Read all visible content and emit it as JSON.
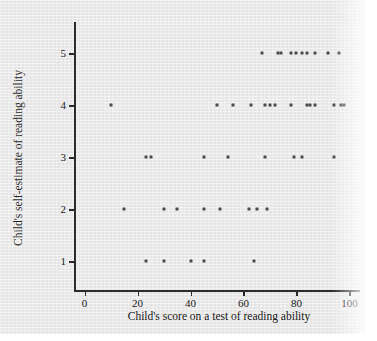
{
  "figure": {
    "background_color": "#e9e9e9",
    "axis_color": "#2b2b2b",
    "marker_color": "#4b4b4b"
  },
  "chart_data": {
    "type": "scatter",
    "title": "",
    "xlabel": "Child's score on a test of reading ability",
    "ylabel": "Child's self-estimate of reading ability",
    "xlim": [
      -4,
      104
    ],
    "ylim": [
      0.45,
      5.6
    ],
    "xticks": [
      0,
      20,
      40,
      60,
      80,
      100
    ],
    "xtick_labels": [
      "0",
      "20",
      "40",
      "60",
      "80",
      "100"
    ],
    "yticks": [
      1,
      2,
      3,
      4,
      5
    ],
    "ytick_labels": [
      "1",
      "2",
      "3",
      "4",
      "5"
    ],
    "grid": false,
    "legend": false,
    "marker": "square-dot",
    "points": [
      {
        "x": 23,
        "y": 1
      },
      {
        "x": 30,
        "y": 1
      },
      {
        "x": 40,
        "y": 1
      },
      {
        "x": 45,
        "y": 1
      },
      {
        "x": 64,
        "y": 1
      },
      {
        "x": 15,
        "y": 2
      },
      {
        "x": 30,
        "y": 2
      },
      {
        "x": 35,
        "y": 2
      },
      {
        "x": 45,
        "y": 2
      },
      {
        "x": 51,
        "y": 2
      },
      {
        "x": 62,
        "y": 2
      },
      {
        "x": 65,
        "y": 2
      },
      {
        "x": 69,
        "y": 2
      },
      {
        "x": 23,
        "y": 3
      },
      {
        "x": 25,
        "y": 3
      },
      {
        "x": 45,
        "y": 3
      },
      {
        "x": 54,
        "y": 3
      },
      {
        "x": 68,
        "y": 3
      },
      {
        "x": 79,
        "y": 3
      },
      {
        "x": 82,
        "y": 3
      },
      {
        "x": 94,
        "y": 3
      },
      {
        "x": 10,
        "y": 4
      },
      {
        "x": 50,
        "y": 4
      },
      {
        "x": 56,
        "y": 4
      },
      {
        "x": 63,
        "y": 4
      },
      {
        "x": 68,
        "y": 4
      },
      {
        "x": 70,
        "y": 4
      },
      {
        "x": 72,
        "y": 4
      },
      {
        "x": 78,
        "y": 4
      },
      {
        "x": 84,
        "y": 4
      },
      {
        "x": 85,
        "y": 4
      },
      {
        "x": 87,
        "y": 4
      },
      {
        "x": 94,
        "y": 4
      },
      {
        "x": 97,
        "y": 4
      },
      {
        "x": 98,
        "y": 4
      },
      {
        "x": 67,
        "y": 5
      },
      {
        "x": 73,
        "y": 5
      },
      {
        "x": 74,
        "y": 5
      },
      {
        "x": 78,
        "y": 5
      },
      {
        "x": 80,
        "y": 5
      },
      {
        "x": 82,
        "y": 5
      },
      {
        "x": 84,
        "y": 5
      },
      {
        "x": 87,
        "y": 5
      },
      {
        "x": 92,
        "y": 5
      },
      {
        "x": 96,
        "y": 5
      }
    ]
  }
}
